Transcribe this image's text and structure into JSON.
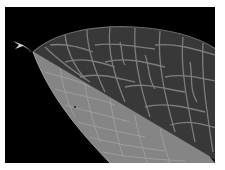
{
  "image": {
    "subject": "Close-up of a leaf tip showing vein network",
    "background_color": "#000000",
    "frame_color": "#ffffff",
    "colors": {
      "upper_half": "#3a3a3a",
      "lower_half": "#8a8a8a",
      "veins_upper": "#8e8e8e",
      "veins_lower": "#b0b0b0"
    }
  }
}
